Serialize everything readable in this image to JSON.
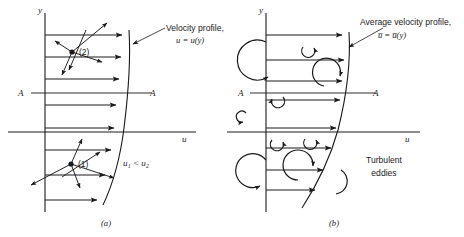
{
  "figure": {
    "title_context": "Laminar and turbulent velocity profiles",
    "colors": {
      "line": "#1a1a1a",
      "background": "#ffffff"
    },
    "panels": [
      {
        "key": "a",
        "caption": "(a)",
        "axis_y_label": "y",
        "axis_u_label": "u",
        "section_label_left": "A",
        "section_label_right": "A",
        "profile_annotation_line1": "Velocity profile,",
        "profile_annotation_line2": "u = u(y)",
        "point_labels": [
          "(2)",
          "(1)"
        ],
        "inequality": "u₁ < u₂",
        "arrow_count": 8
      },
      {
        "key": "b",
        "caption": "(b)",
        "axis_y_label": "y",
        "axis_u_label": "u",
        "section_label_left": "A",
        "section_label_right": "A",
        "profile_annotation_line1": "Average velocity profile,",
        "profile_annotation_line2": "u̅ = u̅(y)",
        "eddies_label_line1": "Turbulent",
        "eddies_label_line2": "eddies",
        "arrow_count": 8
      }
    ]
  }
}
